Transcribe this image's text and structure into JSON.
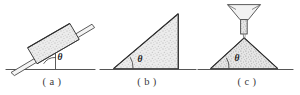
{
  "figure": {
    "panel_count": 3,
    "colors": {
      "background": "#ffffff",
      "outline": "#4a4a4a",
      "outline_dark": "#2e2e2e",
      "ground_line": "#555555",
      "stipple_fill": "#e9e9e9",
      "stipple_dot": "#8d8d8d",
      "label_text": "#1c1c1c",
      "caption_text": "#3a3a3a"
    },
    "ground_line_y": 69,
    "caption_y": 76
  },
  "panels": [
    {
      "id": "a",
      "caption": "( a )",
      "caption_center_x": 52,
      "angle_label": "θ",
      "angle_label_x": 60,
      "angle_label_y": 57,
      "description": "Block of granular material resting on an inclined plane",
      "ground_line": {
        "x1": 6,
        "x2": 95,
        "y": 69
      },
      "incline": {
        "x1": 12,
        "y1": 71,
        "x2": 93,
        "y2": 23
      },
      "vertical_reference": {
        "x": 55,
        "y1": 45,
        "y2": 69
      },
      "block": {
        "shape": "rotated-rectangle",
        "corner_points": "28,48 70,24 79,39 37,63",
        "fill": "stipple"
      }
    },
    {
      "id": "b",
      "caption": "( b )",
      "caption_center_x": 147,
      "angle_label": "θ",
      "angle_label_x": 140,
      "angle_label_y": 59,
      "description": "Right triangular heap of granular material with vertical face",
      "ground_line": {
        "x1": 100,
        "x2": 196,
        "y": 69
      },
      "triangle": {
        "shape": "right-triangle",
        "corner_points": "114,68 178,68 178,14",
        "fill": "stipple"
      }
    },
    {
      "id": "c",
      "caption": "( c )",
      "caption_center_x": 247,
      "angle_label": "θ",
      "angle_label_x": 237,
      "angle_label_y": 58,
      "description": "Conical pile formed by material poured from a funnel",
      "ground_line": {
        "x1": 198,
        "x2": 293,
        "y": 69
      },
      "cone": {
        "shape": "isoceles-triangle",
        "corner_points": "211,68 278,68 244,38",
        "fill": "stipple"
      },
      "funnel": {
        "shape": "funnel",
        "bowl_points": "228,5 260,5 248,20 240,20",
        "stem": {
          "x1": 241,
          "x2": 247,
          "y1": 20,
          "y2": 34
        },
        "stream": {
          "x": 244,
          "y1": 34,
          "y2": 39
        }
      }
    }
  ]
}
